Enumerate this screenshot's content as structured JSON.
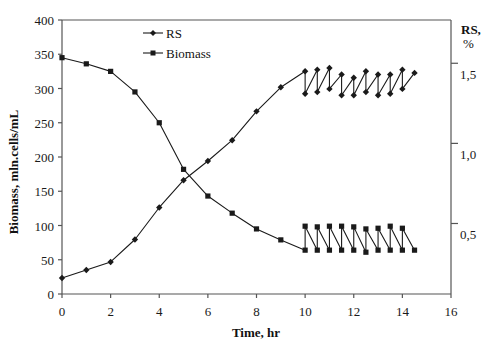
{
  "chart_data": {
    "type": "line",
    "title": "",
    "xlabel": "Time, hr",
    "ylabel": "Biomass, mln.cells/mL",
    "y2label_line1": "RS,",
    "y2label_line2": "%",
    "xlim": [
      0,
      16
    ],
    "ylim": [
      0,
      400
    ],
    "y2lim": [
      0.06,
      1.77
    ],
    "grid": false,
    "legend_position": "upper-left-inside",
    "x_ticks": [
      0,
      2,
      4,
      6,
      8,
      10,
      12,
      14,
      16
    ],
    "x_tick_labels": [
      "0",
      "2",
      "4",
      "6",
      "8",
      "10",
      "12",
      "14",
      "16"
    ],
    "y_ticks": [
      0,
      50,
      100,
      150,
      200,
      250,
      300,
      350,
      400
    ],
    "y_tick_labels": [
      "0",
      "50",
      "100",
      "150",
      "200",
      "250",
      "300",
      "350",
      "400"
    ],
    "y2_ticks": [
      0.5,
      1.0,
      1.5
    ],
    "y2_tick_labels": [
      "0,5",
      "1,0",
      "1,5"
    ],
    "series": [
      {
        "name": "RS",
        "axis": "right",
        "marker": "diamond",
        "x": [
          0,
          1,
          2,
          3,
          4,
          5,
          6,
          7,
          8,
          9,
          10,
          10,
          10.5,
          10.5,
          11,
          11,
          11.5,
          11.5,
          12,
          12,
          12.5,
          12.5,
          13,
          13,
          13.5,
          13.5,
          14,
          14,
          14.5
        ],
        "values": [
          0.16,
          0.21,
          0.26,
          0.4,
          0.6,
          0.77,
          0.89,
          1.02,
          1.2,
          1.35,
          1.45,
          1.31,
          1.46,
          1.32,
          1.47,
          1.34,
          1.43,
          1.3,
          1.41,
          1.3,
          1.45,
          1.32,
          1.43,
          1.3,
          1.43,
          1.31,
          1.46,
          1.34,
          1.44
        ],
        "left_scale_equivalent": [
          25,
          36,
          48,
          78,
          125,
          165,
          194,
          223,
          265,
          300,
          323,
          290,
          324,
          293,
          328,
          296,
          318,
          288,
          315,
          288,
          323,
          292,
          318,
          288,
          318,
          289,
          324,
          295,
          320
        ]
      },
      {
        "name": "Biomass",
        "axis": "left",
        "marker": "square",
        "x": [
          0,
          1,
          2,
          3,
          4,
          5,
          6,
          7,
          8,
          9,
          10,
          10,
          10.5,
          10.5,
          11,
          11,
          11.5,
          11.5,
          12,
          12,
          12.5,
          12.5,
          13,
          13,
          13.5,
          13.5,
          14,
          14,
          14.5
        ],
        "values": [
          345,
          336,
          325,
          295,
          250,
          182,
          143,
          118,
          95,
          79,
          64,
          99,
          64,
          98,
          64,
          99,
          64,
          99,
          64,
          98,
          61,
          95,
          64,
          96,
          64,
          99,
          64,
          96,
          64
        ]
      }
    ]
  },
  "legend": {
    "items": [
      {
        "label": "RS",
        "marker": "diamond"
      },
      {
        "label": "Biomass",
        "marker": "square"
      }
    ]
  },
  "colors": {
    "series": "#1a1a1a",
    "axis": "#555555",
    "background": "#ffffff"
  }
}
